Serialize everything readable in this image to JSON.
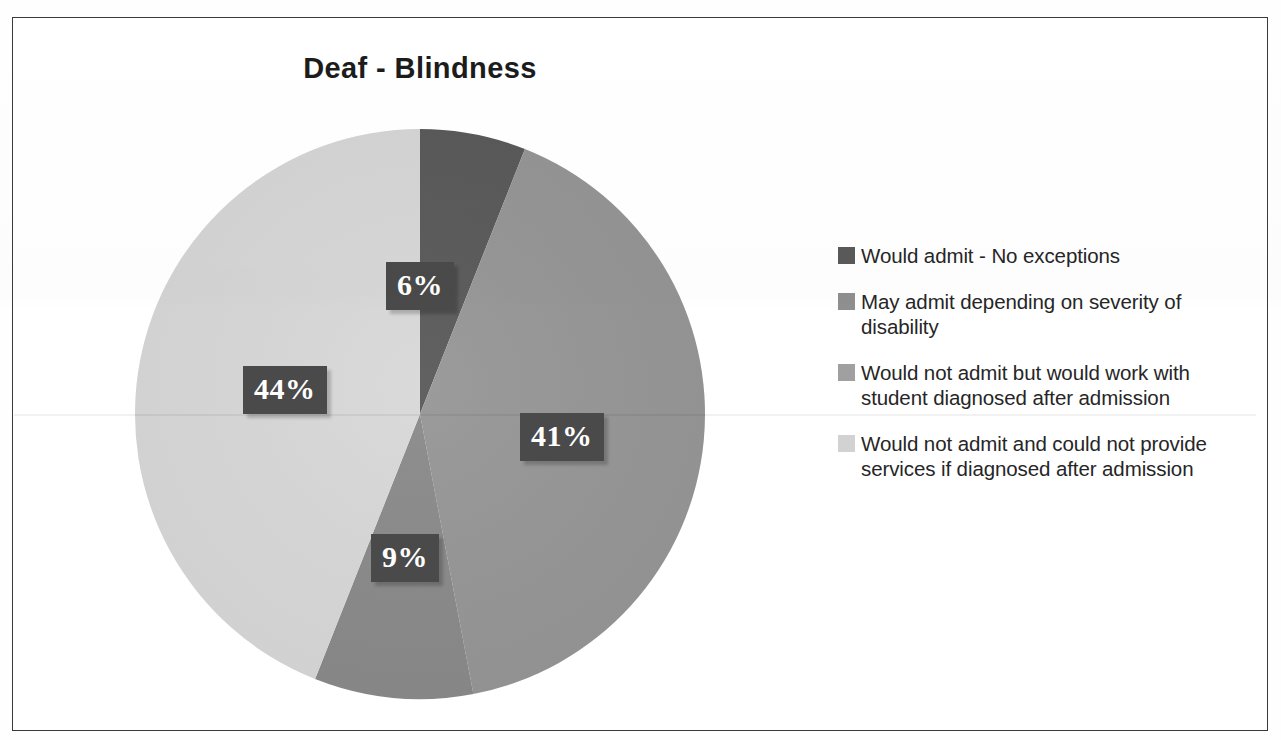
{
  "chart_data": {
    "type": "pie",
    "title": "Deaf - Blindness",
    "categories": [
      "Would admit - No exceptions",
      "May admit depending on severity of disability",
      "Would not admit but would work with student diagnosed after admission",
      "Would not admit and could not provide services if diagnosed after admission"
    ],
    "values": [
      6,
      41,
      9,
      44
    ],
    "value_labels": [
      "6%",
      "41%",
      "9%",
      "44%"
    ],
    "unit": "%",
    "colors": [
      "#595959",
      "#969696",
      "#8a8a8a",
      "#d8d8d8"
    ],
    "start_angle_deg": 0,
    "direction": "clockwise",
    "legend_position": "right",
    "grid": false,
    "xlabel": "",
    "ylabel": ""
  },
  "chart": {
    "title": "Deaf - Blindness"
  },
  "slices": [
    {
      "label": "6%",
      "value": 6,
      "color": "#595959",
      "name": "Would admit - No exceptions"
    },
    {
      "label": "41%",
      "value": 41,
      "color": "#969696",
      "name": "May admit depending on severity of disability"
    },
    {
      "label": "9%",
      "value": 9,
      "color": "#8a8a8a",
      "name": "Would not admit but would work with student diagnosed after admission"
    },
    {
      "label": "44%",
      "value": 44,
      "color": "#d8d8d8",
      "name": "Would not admit and could not provide services if diagnosed after admission"
    }
  ],
  "legend": {
    "items": [
      {
        "swatch_color": "#595959",
        "label": "Would admit - No exceptions"
      },
      {
        "swatch_color": "#8f8f8f",
        "label": "May admit depending on severity of disability"
      },
      {
        "swatch_color": "#a0a0a0",
        "label": "Would not admit but would work with student diagnosed after admission"
      },
      {
        "swatch_color": "#d2d2d2",
        "label": "Would not admit and could not provide services if diagnosed after admission"
      }
    ]
  }
}
